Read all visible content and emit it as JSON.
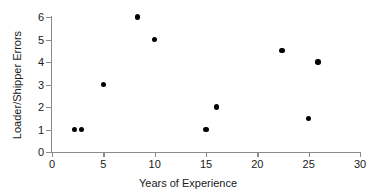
{
  "chart_data": {
    "type": "scatter",
    "title": "",
    "xlabel": "Years of Experience",
    "ylabel": "Loader/Shipper Errors",
    "xlim": [
      0,
      30
    ],
    "ylim": [
      0,
      6
    ],
    "xticks": [
      0,
      5,
      10,
      15,
      20,
      25,
      30
    ],
    "xtick_labels": [
      "0",
      "5",
      "10",
      "15",
      "20",
      "25",
      "30"
    ],
    "yticks": [
      0,
      1,
      2,
      3,
      4,
      5,
      6
    ],
    "ytick_labels": [
      "0",
      "1",
      "2",
      "3",
      "4",
      "5",
      "6"
    ],
    "grid": false,
    "legend": false,
    "marker": "filled-circle",
    "marker_color": "#000000",
    "axis_color": "#8a8a8a",
    "background_color": "#ffffff",
    "points": [
      {
        "x": 2.2,
        "y": 1.0
      },
      {
        "x": 2.9,
        "y": 1.0
      },
      {
        "x": 5.0,
        "y": 3.0
      },
      {
        "x": 8.3,
        "y": 6.0
      },
      {
        "x": 10.0,
        "y": 5.0
      },
      {
        "x": 15.0,
        "y": 1.0
      },
      {
        "x": 16.0,
        "y": 2.0
      },
      {
        "x": 22.4,
        "y": 4.5
      },
      {
        "x": 25.0,
        "y": 1.5
      },
      {
        "x": 25.9,
        "y": 4.0
      }
    ]
  }
}
